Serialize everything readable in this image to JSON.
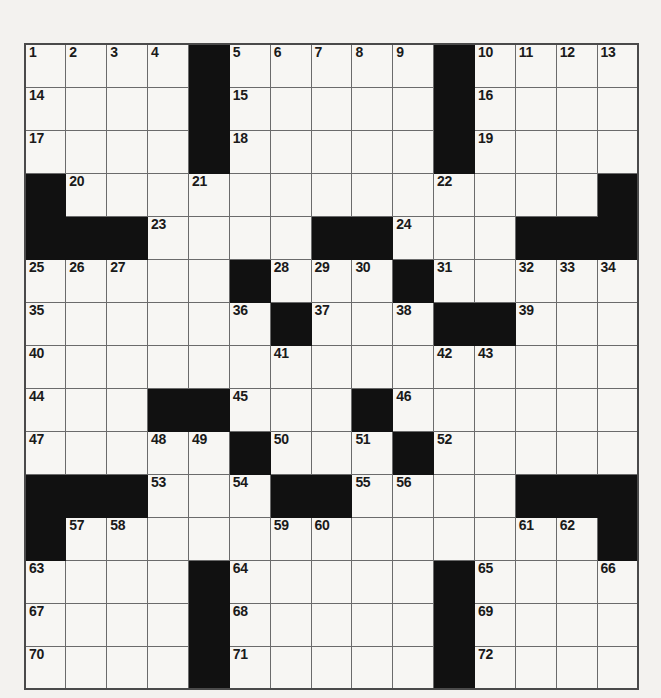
{
  "puzzle": {
    "title": "Crossword Grid",
    "rows": 15,
    "cols": 15,
    "colors": {
      "block": "#111111",
      "cell": "#f7f6f3",
      "gridline": "#6b6b6b",
      "border": "#4a4a4a",
      "number": "#1a1a1a",
      "page_background": "#f3f2ef"
    },
    "grid": [
      [
        {
          "block": false,
          "number": "1"
        },
        {
          "block": false,
          "number": "2"
        },
        {
          "block": false,
          "number": "3"
        },
        {
          "block": false,
          "number": "4"
        },
        {
          "block": true,
          "number": ""
        },
        {
          "block": false,
          "number": "5"
        },
        {
          "block": false,
          "number": "6"
        },
        {
          "block": false,
          "number": "7"
        },
        {
          "block": false,
          "number": "8"
        },
        {
          "block": false,
          "number": "9"
        },
        {
          "block": true,
          "number": ""
        },
        {
          "block": false,
          "number": "10"
        },
        {
          "block": false,
          "number": "11"
        },
        {
          "block": false,
          "number": "12"
        },
        {
          "block": false,
          "number": "13"
        }
      ],
      [
        {
          "block": false,
          "number": "14"
        },
        {
          "block": false,
          "number": ""
        },
        {
          "block": false,
          "number": ""
        },
        {
          "block": false,
          "number": ""
        },
        {
          "block": true,
          "number": ""
        },
        {
          "block": false,
          "number": "15"
        },
        {
          "block": false,
          "number": ""
        },
        {
          "block": false,
          "number": ""
        },
        {
          "block": false,
          "number": ""
        },
        {
          "block": false,
          "number": ""
        },
        {
          "block": true,
          "number": ""
        },
        {
          "block": false,
          "number": "16"
        },
        {
          "block": false,
          "number": ""
        },
        {
          "block": false,
          "number": ""
        },
        {
          "block": false,
          "number": ""
        }
      ],
      [
        {
          "block": false,
          "number": "17"
        },
        {
          "block": false,
          "number": ""
        },
        {
          "block": false,
          "number": ""
        },
        {
          "block": false,
          "number": ""
        },
        {
          "block": true,
          "number": ""
        },
        {
          "block": false,
          "number": "18"
        },
        {
          "block": false,
          "number": ""
        },
        {
          "block": false,
          "number": ""
        },
        {
          "block": false,
          "number": ""
        },
        {
          "block": false,
          "number": ""
        },
        {
          "block": true,
          "number": ""
        },
        {
          "block": false,
          "number": "19"
        },
        {
          "block": false,
          "number": ""
        },
        {
          "block": false,
          "number": ""
        },
        {
          "block": false,
          "number": ""
        }
      ],
      [
        {
          "block": true,
          "number": ""
        },
        {
          "block": false,
          "number": "20"
        },
        {
          "block": false,
          "number": ""
        },
        {
          "block": false,
          "number": ""
        },
        {
          "block": false,
          "number": "21"
        },
        {
          "block": false,
          "number": ""
        },
        {
          "block": false,
          "number": ""
        },
        {
          "block": false,
          "number": ""
        },
        {
          "block": false,
          "number": ""
        },
        {
          "block": false,
          "number": ""
        },
        {
          "block": false,
          "number": "22"
        },
        {
          "block": false,
          "number": ""
        },
        {
          "block": false,
          "number": ""
        },
        {
          "block": false,
          "number": ""
        },
        {
          "block": true,
          "number": ""
        }
      ],
      [
        {
          "block": true,
          "number": ""
        },
        {
          "block": true,
          "number": ""
        },
        {
          "block": true,
          "number": ""
        },
        {
          "block": false,
          "number": "23"
        },
        {
          "block": false,
          "number": ""
        },
        {
          "block": false,
          "number": ""
        },
        {
          "block": false,
          "number": ""
        },
        {
          "block": true,
          "number": ""
        },
        {
          "block": true,
          "number": ""
        },
        {
          "block": false,
          "number": "24"
        },
        {
          "block": false,
          "number": ""
        },
        {
          "block": false,
          "number": ""
        },
        {
          "block": true,
          "number": ""
        },
        {
          "block": true,
          "number": ""
        },
        {
          "block": true,
          "number": ""
        }
      ],
      [
        {
          "block": false,
          "number": "25"
        },
        {
          "block": false,
          "number": "26"
        },
        {
          "block": false,
          "number": "27"
        },
        {
          "block": false,
          "number": ""
        },
        {
          "block": false,
          "number": ""
        },
        {
          "block": true,
          "number": ""
        },
        {
          "block": false,
          "number": "28"
        },
        {
          "block": false,
          "number": "29"
        },
        {
          "block": false,
          "number": "30"
        },
        {
          "block": true,
          "number": ""
        },
        {
          "block": false,
          "number": "31"
        },
        {
          "block": false,
          "number": ""
        },
        {
          "block": false,
          "number": "32"
        },
        {
          "block": false,
          "number": "33"
        },
        {
          "block": false,
          "number": "34"
        }
      ],
      [
        {
          "block": false,
          "number": "35"
        },
        {
          "block": false,
          "number": ""
        },
        {
          "block": false,
          "number": ""
        },
        {
          "block": false,
          "number": ""
        },
        {
          "block": false,
          "number": ""
        },
        {
          "block": false,
          "number": "36"
        },
        {
          "block": true,
          "number": ""
        },
        {
          "block": false,
          "number": "37"
        },
        {
          "block": false,
          "number": ""
        },
        {
          "block": false,
          "number": "38"
        },
        {
          "block": true,
          "number": ""
        },
        {
          "block": true,
          "number": ""
        },
        {
          "block": false,
          "number": "39"
        },
        {
          "block": false,
          "number": ""
        },
        {
          "block": false,
          "number": ""
        }
      ],
      [
        {
          "block": false,
          "number": "40"
        },
        {
          "block": false,
          "number": ""
        },
        {
          "block": false,
          "number": ""
        },
        {
          "block": false,
          "number": ""
        },
        {
          "block": false,
          "number": ""
        },
        {
          "block": false,
          "number": ""
        },
        {
          "block": false,
          "number": "41"
        },
        {
          "block": false,
          "number": ""
        },
        {
          "block": false,
          "number": ""
        },
        {
          "block": false,
          "number": ""
        },
        {
          "block": false,
          "number": "42"
        },
        {
          "block": false,
          "number": "43"
        },
        {
          "block": false,
          "number": ""
        },
        {
          "block": false,
          "number": ""
        },
        {
          "block": false,
          "number": ""
        }
      ],
      [
        {
          "block": false,
          "number": "44"
        },
        {
          "block": false,
          "number": ""
        },
        {
          "block": false,
          "number": ""
        },
        {
          "block": true,
          "number": ""
        },
        {
          "block": true,
          "number": ""
        },
        {
          "block": false,
          "number": "45"
        },
        {
          "block": false,
          "number": ""
        },
        {
          "block": false,
          "number": ""
        },
        {
          "block": true,
          "number": ""
        },
        {
          "block": false,
          "number": "46"
        },
        {
          "block": false,
          "number": ""
        },
        {
          "block": false,
          "number": ""
        },
        {
          "block": false,
          "number": ""
        },
        {
          "block": false,
          "number": ""
        },
        {
          "block": false,
          "number": ""
        }
      ],
      [
        {
          "block": false,
          "number": "47"
        },
        {
          "block": false,
          "number": ""
        },
        {
          "block": false,
          "number": ""
        },
        {
          "block": false,
          "number": "48"
        },
        {
          "block": false,
          "number": "49"
        },
        {
          "block": true,
          "number": ""
        },
        {
          "block": false,
          "number": "50"
        },
        {
          "block": false,
          "number": ""
        },
        {
          "block": false,
          "number": "51"
        },
        {
          "block": true,
          "number": ""
        },
        {
          "block": false,
          "number": "52"
        },
        {
          "block": false,
          "number": ""
        },
        {
          "block": false,
          "number": ""
        },
        {
          "block": false,
          "number": ""
        },
        {
          "block": false,
          "number": ""
        }
      ],
      [
        {
          "block": true,
          "number": ""
        },
        {
          "block": true,
          "number": ""
        },
        {
          "block": true,
          "number": ""
        },
        {
          "block": false,
          "number": "53"
        },
        {
          "block": false,
          "number": ""
        },
        {
          "block": false,
          "number": "54"
        },
        {
          "block": true,
          "number": ""
        },
        {
          "block": true,
          "number": ""
        },
        {
          "block": false,
          "number": "55"
        },
        {
          "block": false,
          "number": "56"
        },
        {
          "block": false,
          "number": ""
        },
        {
          "block": false,
          "number": ""
        },
        {
          "block": true,
          "number": ""
        },
        {
          "block": true,
          "number": ""
        },
        {
          "block": true,
          "number": ""
        }
      ],
      [
        {
          "block": true,
          "number": ""
        },
        {
          "block": false,
          "number": "57"
        },
        {
          "block": false,
          "number": "58"
        },
        {
          "block": false,
          "number": ""
        },
        {
          "block": false,
          "number": ""
        },
        {
          "block": false,
          "number": ""
        },
        {
          "block": false,
          "number": "59"
        },
        {
          "block": false,
          "number": "60"
        },
        {
          "block": false,
          "number": ""
        },
        {
          "block": false,
          "number": ""
        },
        {
          "block": false,
          "number": ""
        },
        {
          "block": false,
          "number": ""
        },
        {
          "block": false,
          "number": "61"
        },
        {
          "block": false,
          "number": "62"
        },
        {
          "block": true,
          "number": ""
        }
      ],
      [
        {
          "block": false,
          "number": "63"
        },
        {
          "block": false,
          "number": ""
        },
        {
          "block": false,
          "number": ""
        },
        {
          "block": false,
          "number": ""
        },
        {
          "block": true,
          "number": ""
        },
        {
          "block": false,
          "number": "64"
        },
        {
          "block": false,
          "number": ""
        },
        {
          "block": false,
          "number": ""
        },
        {
          "block": false,
          "number": ""
        },
        {
          "block": false,
          "number": ""
        },
        {
          "block": true,
          "number": ""
        },
        {
          "block": false,
          "number": "65"
        },
        {
          "block": false,
          "number": ""
        },
        {
          "block": false,
          "number": ""
        },
        {
          "block": false,
          "number": "66"
        }
      ],
      [
        {
          "block": false,
          "number": "67"
        },
        {
          "block": false,
          "number": ""
        },
        {
          "block": false,
          "number": ""
        },
        {
          "block": false,
          "number": ""
        },
        {
          "block": true,
          "number": ""
        },
        {
          "block": false,
          "number": "68"
        },
        {
          "block": false,
          "number": ""
        },
        {
          "block": false,
          "number": ""
        },
        {
          "block": false,
          "number": ""
        },
        {
          "block": false,
          "number": ""
        },
        {
          "block": true,
          "number": ""
        },
        {
          "block": false,
          "number": "69"
        },
        {
          "block": false,
          "number": ""
        },
        {
          "block": false,
          "number": ""
        },
        {
          "block": false,
          "number": ""
        }
      ],
      [
        {
          "block": false,
          "number": "70"
        },
        {
          "block": false,
          "number": ""
        },
        {
          "block": false,
          "number": ""
        },
        {
          "block": false,
          "number": ""
        },
        {
          "block": true,
          "number": ""
        },
        {
          "block": false,
          "number": "71"
        },
        {
          "block": false,
          "number": ""
        },
        {
          "block": false,
          "number": ""
        },
        {
          "block": false,
          "number": ""
        },
        {
          "block": false,
          "number": ""
        },
        {
          "block": true,
          "number": ""
        },
        {
          "block": false,
          "number": "72"
        },
        {
          "block": false,
          "number": ""
        },
        {
          "block": false,
          "number": ""
        },
        {
          "block": false,
          "number": ""
        }
      ]
    ]
  }
}
